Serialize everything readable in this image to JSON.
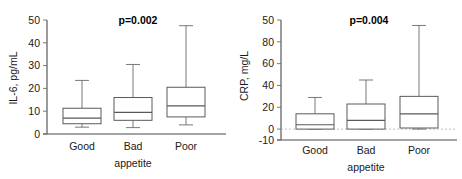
{
  "figure": {
    "background": "#ffffff",
    "line_color": "#5a5a5a",
    "text_color": "#1a1a1a"
  },
  "chart_data": [
    {
      "type": "box",
      "panel_id": "il6",
      "title": "",
      "xlabel": "appetite",
      "ylabel": "IL-6, pg/mL",
      "categories": [
        "Good",
        "Bad",
        "Poor"
      ],
      "ylim": [
        0,
        50
      ],
      "yticks": [
        0,
        10,
        20,
        30,
        40,
        50
      ],
      "yticklabels": [
        "0",
        "10",
        "20",
        "30",
        "40",
        "50"
      ],
      "grid": false,
      "legend": "none",
      "annotation": "p=0.002",
      "boxes": [
        {
          "category": "Good",
          "whisker_low": 3.0,
          "q1": 4.5,
          "median": 7.0,
          "q3": 11.3,
          "whisker_high": 23.5
        },
        {
          "category": "Bad",
          "whisker_low": 2.8,
          "q1": 6.0,
          "median": 9.5,
          "q3": 16.0,
          "whisker_high": 30.5
        },
        {
          "category": "Poor",
          "whisker_low": 4.0,
          "q1": 7.5,
          "median": 12.3,
          "q3": 20.5,
          "whisker_high": 47.5
        }
      ]
    },
    {
      "type": "box",
      "panel_id": "crp",
      "title": "",
      "xlabel": "appetite",
      "ylabel": "CRP, mg/L",
      "categories": [
        "Good",
        "Bad",
        "Poor"
      ],
      "ylim": [
        -10,
        100
      ],
      "yticks": [
        -10,
        0,
        20,
        40,
        60,
        80,
        100
      ],
      "yticklabels": [
        "-10",
        "0",
        "20",
        "40",
        "60",
        "80",
        "50"
      ],
      "grid": false,
      "legend": "none",
      "annotation": "p=0.004",
      "zero_reference_line": 0,
      "boxes": [
        {
          "category": "Good",
          "whisker_low": 0.0,
          "q1": 0.0,
          "median": 4.0,
          "q3": 14.0,
          "whisker_high": 29.0
        },
        {
          "category": "Bad",
          "whisker_low": 0.0,
          "q1": 0.0,
          "median": 8.0,
          "q3": 23.0,
          "whisker_high": 45.0
        },
        {
          "category": "Poor",
          "whisker_low": 0.0,
          "q1": 1.0,
          "median": 14.0,
          "q3": 30.0,
          "whisker_high": 95.0
        }
      ]
    }
  ]
}
